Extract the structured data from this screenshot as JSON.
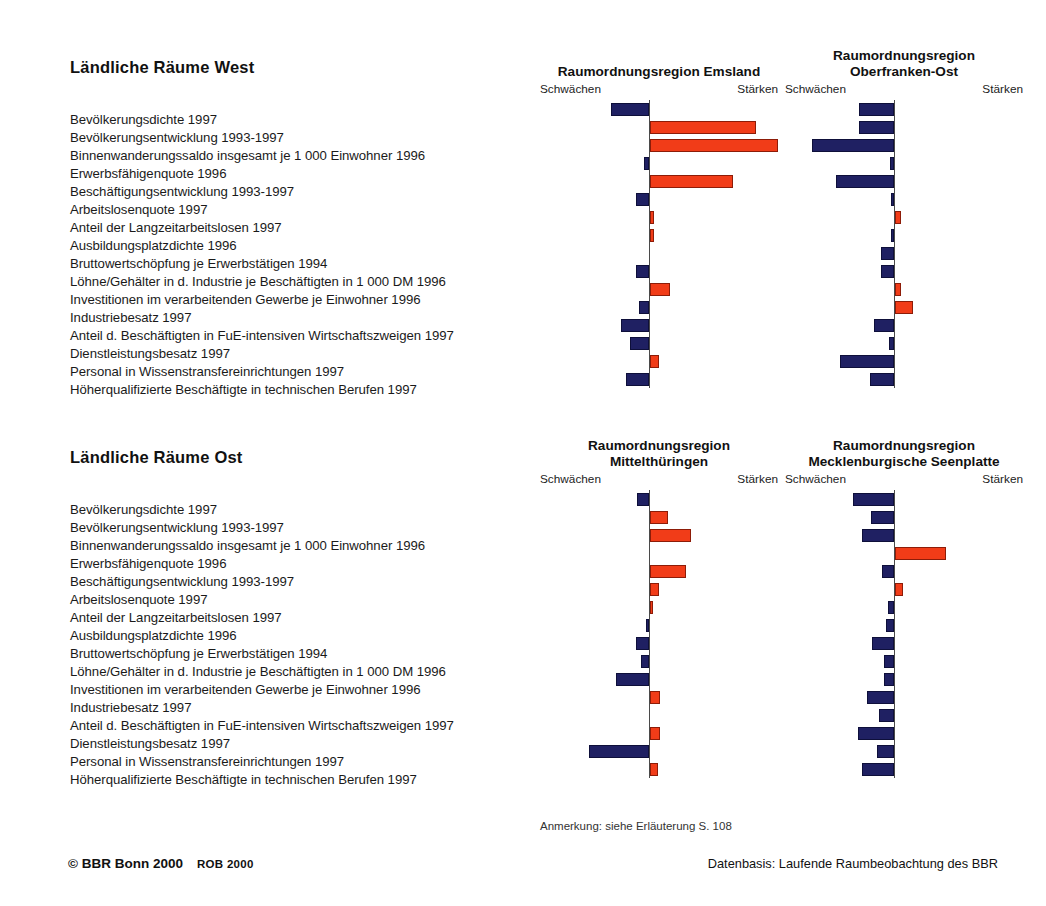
{
  "colors": {
    "weakness": "#1f2062",
    "strength": "#f13c18",
    "axis": "#4a4a4a",
    "text": "#1a1a1a"
  },
  "sections": [
    {
      "title": "Ländliche Räume West"
    },
    {
      "title": "Ländliche Räume Ost"
    }
  ],
  "indicators": [
    "Bevölkerungsdichte 1997",
    "Bevölkerungsentwicklung 1993-1997",
    "Binnenwanderungssaldo insgesamt je 1 000 Einwohner 1996",
    "Erwerbsfähigenquote 1996",
    "Beschäftigungsentwicklung 1993-1997",
    "Arbeitslosenquote 1997",
    "Anteil der Langzeitarbeitslosen 1997",
    "Ausbildungsplatzdichte 1996",
    "Bruttowertschöpfung je Erwerbstätigen 1994",
    "Löhne/Gehälter in d. Industrie je Beschäftigten in 1 000 DM 1996",
    "Investitionen im verarbeitenden Gewerbe je Einwohner 1996",
    "Industriebesatz 1997",
    "Anteil d. Beschäftigten in FuE-intensiven Wirtschaftszweigen 1997",
    "Dienstleistungsbesatz 1997",
    "Personal in Wissenstransfereinrichtungen 1997",
    "Höherqualifizierte Beschäftigte in technischen Berufen 1997"
  ],
  "axis_caption": {
    "left": "Schwächen",
    "right": "Stärken"
  },
  "footer": {
    "note": "Anmerkung: siehe Erläuterung S. 108",
    "copyright_main": "© BBR Bonn 2000",
    "copyright_sub": "ROB 2000",
    "source": "Datenbasis: Laufende Raumbeobachtung des BBR"
  },
  "chart_data": [
    {
      "type": "bar",
      "orientation": "horizontal-diverging",
      "title": "Raumordnungsregion Emsland",
      "title_line1": "Raumordnungsregion Emsland",
      "title_line2": "",
      "group": "Ländliche Räume West",
      "xlabel_left": "Schwächen",
      "xlabel_right": "Stärken",
      "xlim": [
        -100,
        100
      ],
      "grid": false,
      "categories": [
        "Bevölkerungsdichte 1997",
        "Bevölkerungsentwicklung 1993-1997",
        "Binnenwanderungssaldo insgesamt je 1 000 Einwohner 1996",
        "Erwerbsfähigenquote 1996",
        "Beschäftigungsentwicklung 1993-1997",
        "Arbeitslosenquote 1997",
        "Anteil der Langzeitarbeitslosen 1997",
        "Ausbildungsplatzdichte 1996",
        "Bruttowertschöpfung je Erwerbstätigen 1994",
        "Löhne/Gehälter in d. Industrie je Beschäftigten in 1 000 DM 1996",
        "Investitionen im verarbeitenden Gewerbe je Einwohner 1996",
        "Industriebesatz 1997",
        "Anteil d. Beschäftigten in FuE-intensiven Wirtschaftszweigen 1997",
        "Dienstleistungsbesatz 1997",
        "Personal in Wissenstransfereinrichtungen 1997",
        "Höherqualifizierte Beschäftigte in technischen Berufen 1997"
      ],
      "values": [
        -30,
        83,
        100,
        -4,
        65,
        -10,
        3,
        3,
        0,
        -10,
        16,
        -8,
        -22,
        -15,
        7,
        -18
      ]
    },
    {
      "type": "bar",
      "orientation": "horizontal-diverging",
      "title": "Raumordnungsregion Oberfranken-Ost",
      "title_line1": "Raumordnungsregion",
      "title_line2": "Oberfranken-Ost",
      "group": "Ländliche Räume West",
      "xlabel_left": "Schwächen",
      "xlabel_right": "Stärken",
      "xlim": [
        -100,
        100
      ],
      "grid": false,
      "categories": [
        "Bevölkerungsdichte 1997",
        "Bevölkerungsentwicklung 1993-1997",
        "Binnenwanderungssaldo insgesamt je 1 000 Einwohner 1996",
        "Erwerbsfähigenquote 1996",
        "Beschäftigungsentwicklung 1993-1997",
        "Arbeitslosenquote 1997",
        "Anteil der Langzeitarbeitslosen 1997",
        "Ausbildungsplatzdichte 1996",
        "Bruttowertschöpfung je Erwerbstätigen 1994",
        "Löhne/Gehälter in d. Industrie je Beschäftigten in 1 000 DM 1996",
        "Investitionen im verarbeitenden Gewerbe je Einwohner 1996",
        "Industriebesatz 1997",
        "Anteil d. Beschäftigten in FuE-intensiven Wirtschaftszweigen 1997",
        "Dienstleistungsbesatz 1997",
        "Personal in Wissenstransfereinrichtungen 1997",
        "Höherqualifizierte Beschäftigte in technischen Berufen 1997"
      ],
      "values": [
        -27,
        -27,
        -64,
        -3,
        -45,
        -2,
        5,
        -2,
        -10,
        -10,
        5,
        14,
        -16,
        -4,
        -42,
        -19
      ]
    },
    {
      "type": "bar",
      "orientation": "horizontal-diverging",
      "title": "Raumordnungsregion Mittelthüringen",
      "title_line1": "Raumordnungsregion",
      "title_line2": "Mittelthüringen",
      "group": "Ländliche Räume Ost",
      "xlabel_left": "Schwächen",
      "xlabel_right": "Stärken",
      "xlim": [
        -100,
        100
      ],
      "grid": false,
      "categories": [
        "Bevölkerungsdichte 1997",
        "Bevölkerungsentwicklung 1993-1997",
        "Binnenwanderungssaldo insgesamt je 1 000 Einwohner 1996",
        "Erwerbsfähigenquote 1996",
        "Beschäftigungsentwicklung 1993-1997",
        "Arbeitslosenquote 1997",
        "Anteil der Langzeitarbeitslosen 1997",
        "Ausbildungsplatzdichte 1996",
        "Bruttowertschöpfung je Erwerbstätigen 1994",
        "Löhne/Gehälter in d. Industrie je Beschäftigten in 1 000 DM 1996",
        "Investitionen im verarbeitenden Gewerbe je Einwohner 1996",
        "Industriebesatz 1997",
        "Anteil d. Beschäftigten in FuE-intensiven Wirtschaftszweigen 1997",
        "Dienstleistungsbesatz 1997",
        "Personal in Wissenstransfereinrichtungen 1997",
        "Höherqualifizierte Beschäftigte in technischen Berufen 1997"
      ],
      "values": [
        -9,
        14,
        32,
        0,
        28,
        7,
        2,
        -2,
        -10,
        -6,
        -26,
        8,
        0,
        8,
        -47,
        6
      ]
    },
    {
      "type": "bar",
      "orientation": "horizontal-diverging",
      "title": "Raumordnungsregion Mecklenburgische Seenplatte",
      "title_line1": "Raumordnungsregion",
      "title_line2": "Mecklenburgische Seenplatte",
      "group": "Ländliche Räume Ost",
      "xlabel_left": "Schwächen",
      "xlabel_right": "Stärken",
      "xlim": [
        -100,
        100
      ],
      "grid": false,
      "categories": [
        "Bevölkerungsdichte 1997",
        "Bevölkerungsentwicklung 1993-1997",
        "Binnenwanderungssaldo insgesamt je 1 000 Einwohner 1996",
        "Erwerbsfähigenquote 1996",
        "Beschäftigungsentwicklung 1993-1997",
        "Arbeitslosenquote 1997",
        "Anteil der Langzeitarbeitslosen 1997",
        "Ausbildungsplatzdichte 1996",
        "Bruttowertschöpfung je Erwerbstätigen 1994",
        "Löhne/Gehälter in d. Industrie je Beschäftigten in 1 000 DM 1996",
        "Investitionen im verarbeitenden Gewerbe je Einwohner 1996",
        "Industriebesatz 1997",
        "Anteil d. Beschäftigten in FuE-intensiven Wirtschaftszweigen 1997",
        "Dienstleistungsbesatz 1997",
        "Personal in Wissenstransfereinrichtungen 1997",
        "Höherqualifizierte Beschäftigte in technischen Berufen 1997"
      ],
      "values": [
        -32,
        -18,
        -25,
        40,
        -9,
        6,
        -5,
        -6,
        -17,
        -8,
        -8,
        -21,
        -12,
        -28,
        -13,
        -25
      ]
    }
  ]
}
